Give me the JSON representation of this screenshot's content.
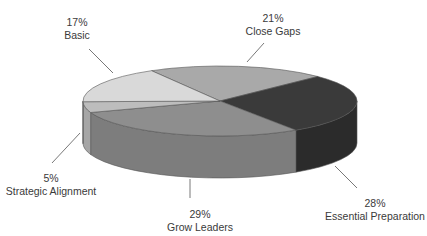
{
  "chart_data": {
    "type": "pie",
    "style": "3d",
    "title": "",
    "categories": [
      "Close Gaps",
      "Essential Preparation",
      "Grow Leaders",
      "Strategic Alignment",
      "Basic"
    ],
    "values": [
      21,
      28,
      29,
      5,
      17
    ],
    "value_format": "percent",
    "colors": [
      "#a9a9a9",
      "#3a3a3a",
      "#8e8e8e",
      "#bdbdbd",
      "#d9d9d9"
    ],
    "side_colors": [
      "#8f8f8f",
      "#2b2b2b",
      "#7d7d7d",
      "#a6a6a6",
      "#c4c4c4"
    ],
    "legend": "none",
    "labels": [
      {
        "pct": "21%",
        "name": "Close Gaps",
        "x": 273,
        "y": 12,
        "line": [
          264,
          43,
          247,
          62
        ]
      },
      {
        "pct": "28%",
        "name": "Essential Preparation",
        "x": 375,
        "y": 197,
        "line": [
          335,
          166,
          357,
          188
        ]
      },
      {
        "pct": "29%",
        "name": "Grow Leaders",
        "x": 200,
        "y": 208,
        "line": [
          190,
          179,
          190,
          198
        ]
      },
      {
        "pct": "5%",
        "name": "Strategic Alignment",
        "x": 51,
        "y": 172,
        "line": [
          80,
          133,
          52,
          163
        ]
      },
      {
        "pct": "17%",
        "name": "Basic",
        "x": 77,
        "y": 16,
        "line": [
          89,
          49,
          113,
          73
        ]
      }
    ],
    "geometry": {
      "cx": 220,
      "cy": 101,
      "rx": 137,
      "ry": 35,
      "depth": 42,
      "start_angle_deg": -120
    }
  }
}
